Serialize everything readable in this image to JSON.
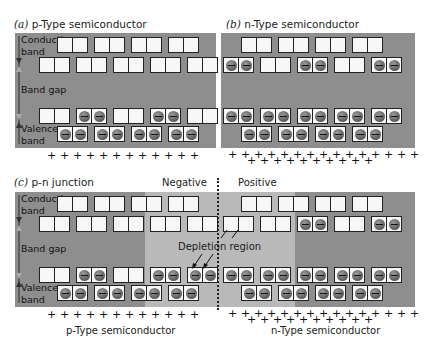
{
  "panels": {
    "a": {
      "prefix": "(a)",
      "title": "p-Type semiconductor"
    },
    "b": {
      "prefix": "(b)",
      "title": "n-Type semiconductor"
    },
    "c": {
      "prefix": "(c)",
      "title": "p-n junction"
    }
  },
  "labels": {
    "conduction": "Conduction band",
    "conduction_1": "Conduction",
    "conduction_2": "band",
    "band_gap": "Band gap",
    "valence_1": "Valence",
    "valence_2": "band",
    "negative": "Negative",
    "positive": "Positive",
    "depletion_region": "Depletion region",
    "p_type_caption": "p-Type semiconductor",
    "n_type_caption": "n-Type semiconductor"
  },
  "symbols": {
    "plus": "+",
    "electron": "⊖"
  },
  "colors": {
    "panel_gray": "#8e8e8e",
    "depletion_gray": "#b9b9b9",
    "cell_fill": "#f7f7f7",
    "electron": "#666666"
  },
  "rows": {
    "a": {
      "conduction_upper": [
        "empty",
        "empty",
        "empty",
        "empty"
      ],
      "conduction_lower": [
        "empty",
        "empty",
        "empty",
        "empty",
        "empty"
      ],
      "valence_upper": [
        "empty",
        "filled",
        "empty",
        "filled",
        "empty"
      ],
      "valence_lower": [
        "filled",
        "filled",
        "filled",
        "filled"
      ]
    },
    "b": {
      "conduction_upper": [
        "empty",
        "empty",
        "empty",
        "empty"
      ],
      "conduction_lower": [
        "filled",
        "empty",
        "filled",
        "empty",
        "filled"
      ],
      "valence_upper": [
        "filled",
        "filled",
        "filled",
        "filled",
        "filled"
      ],
      "valence_lower": [
        "filled",
        "filled",
        "filled",
        "filled"
      ]
    },
    "c_left": {
      "conduction_upper": [
        "empty",
        "empty",
        "empty",
        "empty"
      ],
      "conduction_lower": [
        "empty",
        "empty",
        "empty",
        "empty",
        "empty"
      ],
      "valence_upper": [
        "empty",
        "filled",
        "empty",
        "filled",
        "filled"
      ],
      "valence_lower": [
        "filled",
        "filled",
        "filled",
        "filled"
      ]
    },
    "c_right": {
      "conduction_upper": [
        "empty",
        "empty",
        "empty",
        "empty"
      ],
      "conduction_lower": [
        "empty",
        "empty",
        "filled",
        "empty",
        "filled"
      ],
      "valence_upper": [
        "filled",
        "filled",
        "filled",
        "filled",
        "filled"
      ],
      "valence_lower": [
        "filled",
        "filled",
        "filled",
        "filled"
      ]
    }
  },
  "plus_rows": {
    "p_type_count": 12,
    "n_type_top_count": 15,
    "n_type_bottom_count": 10
  }
}
